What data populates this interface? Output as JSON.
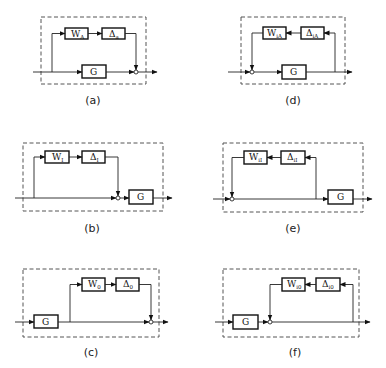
{
  "figure": {
    "panels": [
      {
        "id": "a",
        "caption": "(a)",
        "weight": {
          "base": "W",
          "sub": "A"
        },
        "delta": {
          "base": "Δ",
          "sub": "a"
        },
        "plant": "G",
        "type": "additive-input"
      },
      {
        "id": "b",
        "caption": "(b)",
        "weight": {
          "base": "W",
          "sub": "I"
        },
        "delta": {
          "base": "Δ",
          "sub": "I"
        },
        "plant": "G",
        "type": "input-multiplicative"
      },
      {
        "id": "c",
        "caption": "(c)",
        "weight": {
          "base": "W",
          "sub": "0"
        },
        "delta": {
          "base": "Δ",
          "sub": "0"
        },
        "plant": "G",
        "type": "output-multiplicative"
      },
      {
        "id": "d",
        "caption": "(d)",
        "weight": {
          "base": "W",
          "sub": "iA"
        },
        "delta": {
          "base": "Δ",
          "sub": "iA"
        },
        "plant": "G",
        "type": "inverse-additive"
      },
      {
        "id": "e",
        "caption": "(e)",
        "weight": {
          "base": "W",
          "sub": "iI"
        },
        "delta": {
          "base": "Δ",
          "sub": "iI"
        },
        "plant": "G",
        "type": "inverse-input-multiplicative"
      },
      {
        "id": "f",
        "caption": "(f)",
        "weight": {
          "base": "W",
          "sub": "i0"
        },
        "delta": {
          "base": "Δ",
          "sub": "i0"
        },
        "plant": "G",
        "type": "inverse-output-multiplicative"
      }
    ]
  }
}
